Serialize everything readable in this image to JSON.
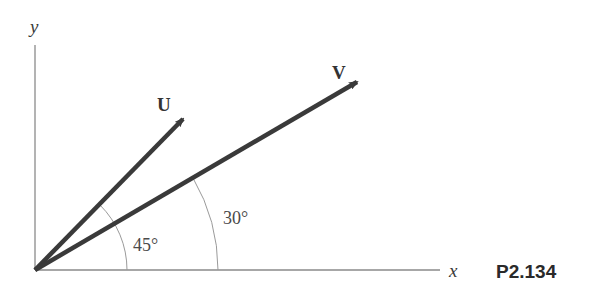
{
  "figure": {
    "id_label": "P2.134",
    "colors": {
      "axis": "#8a8a8a",
      "vector": "#3a3a3a",
      "arc": "#9a9a9a",
      "text": "#3a3a3a"
    }
  },
  "axes": {
    "x_label": "x",
    "y_label": "y"
  },
  "vectors": [
    {
      "name": "U",
      "label": "U",
      "angle_deg": 45
    },
    {
      "name": "V",
      "label": "V",
      "angle_deg": 30
    }
  ],
  "angles": [
    {
      "label": "45°",
      "between": [
        "x-axis",
        "U"
      ]
    },
    {
      "label": "30°",
      "between": [
        "x-axis",
        "V"
      ]
    }
  ]
}
